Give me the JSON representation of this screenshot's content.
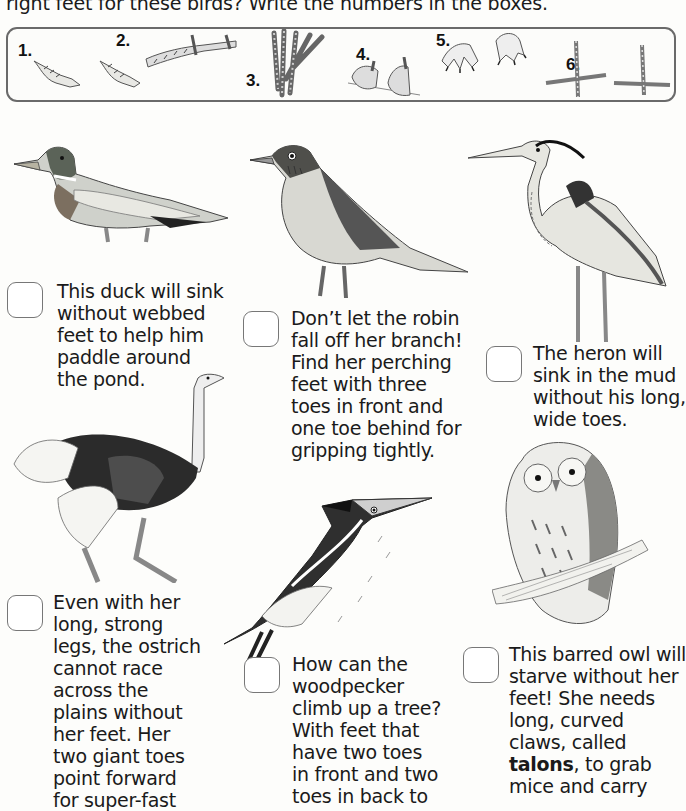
{
  "instructions": "right feet for these birds? Write the numbers in the boxes.",
  "feet_options": [
    {
      "number": "1.",
      "description": "webbed duck feet"
    },
    {
      "number": "2.",
      "description": "long wide heron toes"
    },
    {
      "number": "3.",
      "description": "long grasping toes"
    },
    {
      "number": "4.",
      "description": "perching feet gripping branch"
    },
    {
      "number": "5.",
      "description": "curved talons"
    },
    {
      "number": "6.",
      "description": "two toes front two toes back"
    }
  ],
  "birds": [
    {
      "name": "duck",
      "answer": "",
      "caption_lines": [
        "This duck will sink",
        "without webbed",
        "feet to help him",
        "paddle around",
        "the pond."
      ]
    },
    {
      "name": "robin",
      "answer": "",
      "caption_lines": [
        "Don’t let the robin",
        "fall off her branch!",
        "Find her perching",
        "feet with three",
        "toes in front and",
        "one toe behind for",
        "gripping tightly."
      ]
    },
    {
      "name": "heron",
      "answer": "",
      "caption_lines": [
        "The heron will",
        "sink in the mud",
        "without his long,",
        "wide toes."
      ]
    },
    {
      "name": "ostrich",
      "answer": "",
      "caption_lines": [
        "Even with her",
        "long, strong",
        "legs, the ostrich",
        "cannot race",
        "across the",
        "plains without",
        "her feet. Her",
        "two giant toes",
        "point forward",
        "for super-fast"
      ]
    },
    {
      "name": "woodpecker",
      "answer": "",
      "caption_lines": [
        "How can the",
        "woodpecker",
        "climb up a tree?",
        "With feet that",
        "have two toes",
        "in front and two",
        "toes in back to"
      ]
    },
    {
      "name": "barred-owl",
      "answer": "",
      "caption_lines": [
        "This barred owl will",
        "starve without her",
        "feet! She needs",
        "long, curved",
        "claws, called"
      ],
      "caption_bold_word": "talons",
      "caption_after_bold": ", to grab",
      "caption_tail_lines": [
        "mice and carry"
      ]
    }
  ]
}
